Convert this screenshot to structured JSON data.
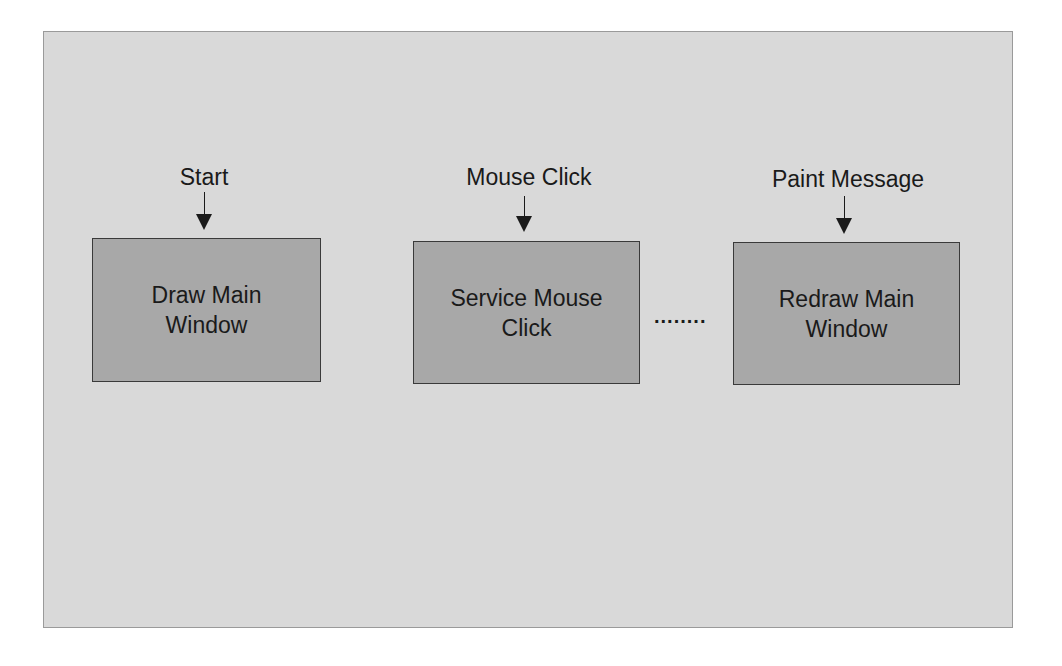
{
  "diagram": {
    "nodes": [
      {
        "id": "draw",
        "event": "Start",
        "label": "Draw Main\nWindow"
      },
      {
        "id": "service",
        "event": "Mouse Click",
        "label": "Service Mouse\nClick"
      },
      {
        "id": "redraw",
        "event": "Paint Message",
        "label": "Redraw Main\nWindow"
      }
    ],
    "ellipsis": "........",
    "colors": {
      "background": "#d9d9d9",
      "box_fill": "#a8a8a8",
      "box_border": "#3a3a3a",
      "text": "#1a1a1a"
    }
  }
}
